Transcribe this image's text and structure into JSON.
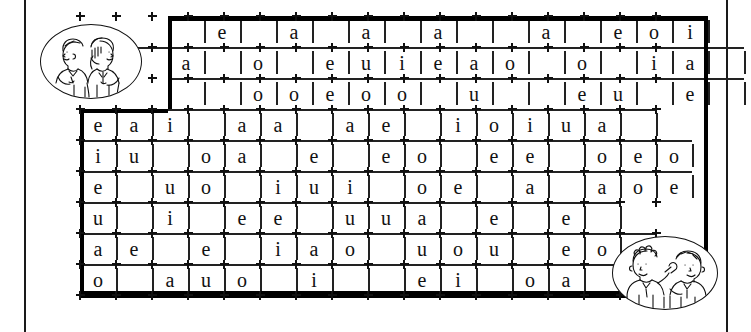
{
  "page": {
    "type": "crossword-vowel-worksheet",
    "background_color": "#ffffff",
    "ink_color": "#111111"
  },
  "grid": {
    "columns": 16,
    "rows": 9,
    "cell_width": 36,
    "cell_height": 31,
    "rows_data": [
      {
        "row": 1,
        "letters": [
          {
            "col": 2,
            "letter": "e"
          },
          {
            "col": 4,
            "letter": "a"
          },
          {
            "col": 6,
            "letter": "a"
          },
          {
            "col": 8,
            "letter": "a"
          },
          {
            "col": 11,
            "letter": "a"
          },
          {
            "col": 13,
            "letter": "e"
          },
          {
            "col": 14,
            "letter": "o"
          },
          {
            "col": 15,
            "letter": "i"
          }
        ]
      },
      {
        "row": 2,
        "letters": [
          {
            "col": 1,
            "letter": "a"
          },
          {
            "col": 3,
            "letter": "o"
          },
          {
            "col": 5,
            "letter": "e"
          },
          {
            "col": 6,
            "letter": "u"
          },
          {
            "col": 7,
            "letter": "i"
          },
          {
            "col": 8,
            "letter": "e"
          },
          {
            "col": 9,
            "letter": "a"
          },
          {
            "col": 10,
            "letter": "o"
          },
          {
            "col": 12,
            "letter": "o"
          },
          {
            "col": 14,
            "letter": "i"
          },
          {
            "col": 15,
            "letter": "a"
          },
          {
            "col": 16,
            "letter": "e"
          }
        ]
      },
      {
        "row": 3,
        "letters": [
          {
            "col": 3,
            "letter": "o"
          },
          {
            "col": 4,
            "letter": "o"
          },
          {
            "col": 5,
            "letter": "e"
          },
          {
            "col": 6,
            "letter": "o"
          },
          {
            "col": 7,
            "letter": "o"
          },
          {
            "col": 9,
            "letter": "u"
          },
          {
            "col": 12,
            "letter": "e"
          },
          {
            "col": 13,
            "letter": "u"
          },
          {
            "col": 15,
            "letter": "e"
          },
          {
            "col": 16,
            "letter": "o"
          }
        ]
      },
      {
        "row": 4,
        "letters": [
          {
            "col": 0,
            "letter": "e"
          },
          {
            "col": 1,
            "letter": "a"
          },
          {
            "col": 2,
            "letter": "i"
          },
          {
            "col": 4,
            "letter": "a"
          },
          {
            "col": 5,
            "letter": "a"
          },
          {
            "col": 7,
            "letter": "a"
          },
          {
            "col": 8,
            "letter": "e"
          },
          {
            "col": 10,
            "letter": "i"
          },
          {
            "col": 11,
            "letter": "o"
          },
          {
            "col": 12,
            "letter": "i"
          },
          {
            "col": 13,
            "letter": "u"
          },
          {
            "col": 14,
            "letter": "a"
          }
        ]
      },
      {
        "row": 5,
        "letters": [
          {
            "col": 0,
            "letter": "i"
          },
          {
            "col": 1,
            "letter": "u"
          },
          {
            "col": 3,
            "letter": "o"
          },
          {
            "col": 4,
            "letter": "a"
          },
          {
            "col": 6,
            "letter": "e"
          },
          {
            "col": 8,
            "letter": "e"
          },
          {
            "col": 9,
            "letter": "o"
          },
          {
            "col": 11,
            "letter": "e"
          },
          {
            "col": 12,
            "letter": "e"
          },
          {
            "col": 14,
            "letter": "o"
          },
          {
            "col": 15,
            "letter": "e"
          },
          {
            "col": 16,
            "letter": "o"
          }
        ]
      },
      {
        "row": 6,
        "letters": [
          {
            "col": 0,
            "letter": "e"
          },
          {
            "col": 2,
            "letter": "u"
          },
          {
            "col": 3,
            "letter": "o"
          },
          {
            "col": 5,
            "letter": "i"
          },
          {
            "col": 6,
            "letter": "u"
          },
          {
            "col": 7,
            "letter": "i"
          },
          {
            "col": 9,
            "letter": "o"
          },
          {
            "col": 10,
            "letter": "e"
          },
          {
            "col": 12,
            "letter": "a"
          },
          {
            "col": 14,
            "letter": "a"
          },
          {
            "col": 15,
            "letter": "o"
          },
          {
            "col": 16,
            "letter": "e"
          }
        ]
      },
      {
        "row": 7,
        "letters": [
          {
            "col": 0,
            "letter": "u"
          },
          {
            "col": 2,
            "letter": "i"
          },
          {
            "col": 4,
            "letter": "e"
          },
          {
            "col": 5,
            "letter": "e"
          },
          {
            "col": 7,
            "letter": "u"
          },
          {
            "col": 8,
            "letter": "u"
          },
          {
            "col": 9,
            "letter": "a"
          },
          {
            "col": 11,
            "letter": "e"
          },
          {
            "col": 13,
            "letter": "e"
          }
        ]
      },
      {
        "row": 8,
        "letters": [
          {
            "col": 0,
            "letter": "a"
          },
          {
            "col": 1,
            "letter": "e"
          },
          {
            "col": 3,
            "letter": "e"
          },
          {
            "col": 5,
            "letter": "i"
          },
          {
            "col": 6,
            "letter": "a"
          },
          {
            "col": 7,
            "letter": "o"
          },
          {
            "col": 9,
            "letter": "u"
          },
          {
            "col": 10,
            "letter": "o"
          },
          {
            "col": 11,
            "letter": "u"
          },
          {
            "col": 13,
            "letter": "e"
          },
          {
            "col": 14,
            "letter": "o"
          },
          {
            "col": 15,
            "letter": "i"
          }
        ]
      },
      {
        "row": 9,
        "letters": [
          {
            "col": 0,
            "letter": "o"
          },
          {
            "col": 2,
            "letter": "a"
          },
          {
            "col": 3,
            "letter": "u"
          },
          {
            "col": 4,
            "letter": "o"
          },
          {
            "col": 6,
            "letter": "i"
          },
          {
            "col": 9,
            "letter": "e"
          },
          {
            "col": 10,
            "letter": "i"
          },
          {
            "col": 12,
            "letter": "o"
          },
          {
            "col": 13,
            "letter": "a"
          },
          {
            "col": 15,
            "letter": "e"
          }
        ]
      }
    ]
  },
  "illustrations": [
    {
      "name": "two-children-back-to-back",
      "position": "top-left",
      "description": "Line drawing of a boy and a girl standing back to back inside an oval frame"
    },
    {
      "name": "two-children-talking",
      "position": "bottom-right",
      "description": "Line drawing of two children facing each other, one holding an object, inside an oval frame"
    }
  ]
}
